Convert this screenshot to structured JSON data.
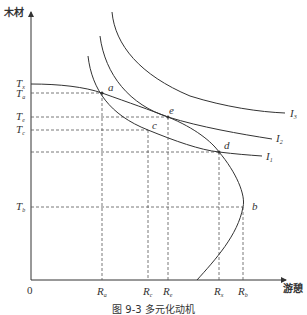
{
  "figure": {
    "caption": "图 9-3  多元化动机",
    "y_axis_label": "木材",
    "x_axis_label": "游憩",
    "origin_label": "0"
  },
  "y_ticks": [
    {
      "base": "T",
      "sub": "x",
      "y": 84
    },
    {
      "base": "T",
      "sub": "a",
      "y": 93
    },
    {
      "base": "T",
      "sub": "e",
      "y": 117
    },
    {
      "base": "T",
      "sub": "c",
      "y": 130
    },
    {
      "base": "T",
      "sub": "b",
      "y": 207
    }
  ],
  "x_ticks": [
    {
      "base": "R",
      "sub": "a",
      "x": 102
    },
    {
      "base": "R",
      "sub": "c",
      "x": 148
    },
    {
      "base": "R",
      "sub": "e",
      "x": 168
    },
    {
      "base": "R",
      "sub": "x",
      "x": 219
    },
    {
      "base": "R",
      "sub": "b",
      "x": 243
    }
  ],
  "points": [
    {
      "label": "a",
      "x": 102,
      "y": 93
    },
    {
      "label": "e",
      "x": 168,
      "y": 117
    },
    {
      "label": "c",
      "x": 148,
      "y": 130
    },
    {
      "label": "d",
      "x": 219,
      "y": 152
    },
    {
      "label": "b",
      "x": 243,
      "y": 207
    }
  ],
  "curves": {
    "indifference": [
      {
        "base": "I",
        "sub": "1"
      },
      {
        "base": "I",
        "sub": "2"
      },
      {
        "base": "I",
        "sub": "3"
      }
    ],
    "production_possibility": "backward-bending frontier"
  },
  "colors": {
    "line": "#333333",
    "dash": "#555555",
    "background": "#ffffff"
  }
}
